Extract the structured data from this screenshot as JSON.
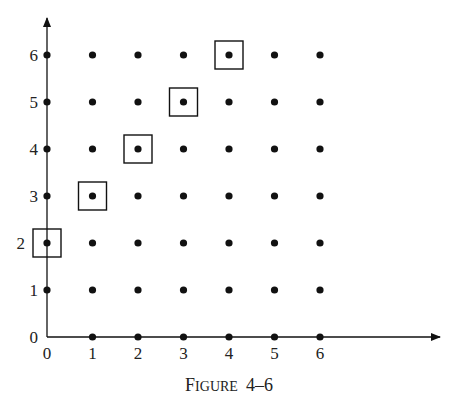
{
  "caption": {
    "big1": "F",
    "small": "IGURE",
    "num": "4–6"
  },
  "axes": {
    "x_ticks": [
      "0",
      "1",
      "2",
      "3",
      "4",
      "5",
      "6"
    ],
    "y_ticks": [
      "0",
      "1",
      "2",
      "3",
      "4",
      "5",
      "6"
    ]
  },
  "chart_data": {
    "type": "scatter",
    "xlabel": "",
    "ylabel": "",
    "xlim": [
      0,
      6
    ],
    "ylim": [
      0,
      6
    ],
    "grid": false,
    "points": "all integer pairs (x,y), 0<=x<=6, 0<=y<=6, excluding (0,0)",
    "highlighted": [
      [
        0,
        2
      ],
      [
        1,
        3
      ],
      [
        2,
        4
      ],
      [
        3,
        5
      ],
      [
        4,
        6
      ]
    ]
  },
  "colors": {
    "ink": "#111111",
    "background": "#ffffff"
  }
}
